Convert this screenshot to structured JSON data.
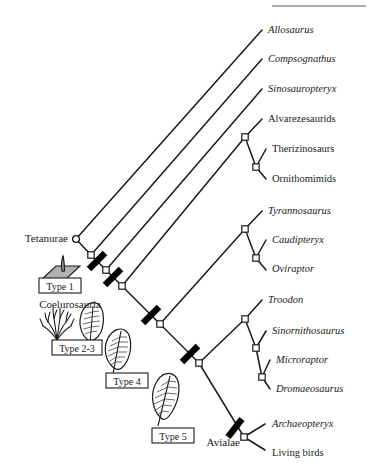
{
  "figure": {
    "top_rule": true,
    "colors": {
      "line": "#1a1a1a",
      "text": "#1a1a1a",
      "bar": "#000000",
      "patch_fill": "#b0b0b0",
      "background": "#ffffff"
    }
  },
  "tips": [
    {
      "id": "allosaurus",
      "label": "Allosaurus",
      "italic": true,
      "x": 268,
      "y": 33
    },
    {
      "id": "compsognathus",
      "label": "Compsognathus",
      "italic": true,
      "x": 268,
      "y": 62
    },
    {
      "id": "sinosauropteryx",
      "label": "Sinosauropteryx",
      "italic": true,
      "x": 268,
      "y": 92
    },
    {
      "id": "alvarezesaurids",
      "label": "Alvarezesaurids",
      "italic": false,
      "x": 268,
      "y": 122
    },
    {
      "id": "therizinosaurs",
      "label": "Therizinosaurs",
      "italic": false,
      "x": 272,
      "y": 152
    },
    {
      "id": "ornithomimids",
      "label": "Ornithomimids",
      "italic": false,
      "x": 272,
      "y": 182
    },
    {
      "id": "tyrannosaurus",
      "label": "Tyrannosaurus",
      "italic": true,
      "x": 268,
      "y": 214
    },
    {
      "id": "caudipteryx",
      "label": "Caudipteryx",
      "italic": true,
      "x": 272,
      "y": 243
    },
    {
      "id": "oviraptor",
      "label": "Oviraptor",
      "italic": true,
      "x": 272,
      "y": 272
    },
    {
      "id": "troodon",
      "label": "Troodon",
      "italic": true,
      "x": 268,
      "y": 303
    },
    {
      "id": "sinornithosaurus",
      "label": "Sinornithosaurus",
      "italic": true,
      "x": 272,
      "y": 334
    },
    {
      "id": "microraptor",
      "label": "Microraptor",
      "italic": true,
      "x": 276,
      "y": 363
    },
    {
      "id": "dromaeosaurus",
      "label": "Dromaeosaurus",
      "italic": true,
      "x": 276,
      "y": 392
    },
    {
      "id": "archaeopteryx",
      "label": "Archaeopteryx",
      "italic": true,
      "x": 272,
      "y": 427
    },
    {
      "id": "living_birds",
      "label": "Living birds",
      "italic": false,
      "x": 272,
      "y": 453
    }
  ],
  "clades": [
    {
      "id": "tetanurae",
      "label": "Tetanurae",
      "x": 68,
      "y": 242,
      "anchor": "end"
    },
    {
      "id": "coelurosauria",
      "label": "Coelurosauria",
      "x": 70,
      "y": 305,
      "anchor": "middle"
    },
    {
      "id": "avialae",
      "label": "Avialae",
      "x": 242,
      "y": 443,
      "anchor": "end"
    }
  ],
  "feather_types": [
    {
      "id": "type1",
      "label": "Type 1",
      "box_x": 39,
      "box_y": 278,
      "box_w": 42,
      "box_h": 14
    },
    {
      "id": "type2_3",
      "label": "Type 2-3",
      "box_x": 52,
      "box_y": 340,
      "box_w": 50,
      "box_h": 14
    },
    {
      "id": "type4",
      "label": "Type 4",
      "box_x": 106,
      "box_y": 373,
      "box_w": 42,
      "box_h": 14
    },
    {
      "id": "type5",
      "label": "Type 5",
      "box_x": 152,
      "box_y": 428,
      "box_w": 42,
      "box_h": 14
    }
  ],
  "icons": {
    "type1": "filament-on-skin-patch-icon",
    "type2_3": "branched-filament-tuft-icon",
    "type2_3b": "downy-feather-icon",
    "type4": "pennaceous-feather-icon",
    "type5": "asymmetric-flight-feather-icon",
    "node_open": "open-node-marker-icon",
    "bar": "character-state-bar-icon"
  },
  "nodes": [
    {
      "id": "n_tetanurae",
      "x": 76,
      "y": 239,
      "shape": "circle"
    },
    {
      "id": "n_coel",
      "x": 91,
      "y": 255,
      "shape": "square"
    },
    {
      "id": "n_b2",
      "x": 106,
      "y": 270,
      "shape": "square"
    },
    {
      "id": "n_b3",
      "x": 122,
      "y": 286,
      "shape": "square"
    },
    {
      "id": "n_b4",
      "x": 160,
      "y": 324,
      "shape": "square"
    },
    {
      "id": "n_b5",
      "x": 199,
      "y": 363,
      "shape": "square"
    },
    {
      "id": "n_b6",
      "x": 244,
      "y": 437,
      "shape": "square"
    },
    {
      "id": "n_mani1",
      "x": 245,
      "y": 137,
      "shape": "square"
    },
    {
      "id": "n_mani2",
      "x": 256,
      "y": 167,
      "shape": "square"
    },
    {
      "id": "n_ovi1",
      "x": 245,
      "y": 229,
      "shape": "square"
    },
    {
      "id": "n_ovi2",
      "x": 256,
      "y": 258,
      "shape": "square"
    },
    {
      "id": "n_dro1",
      "x": 245,
      "y": 319,
      "shape": "square"
    },
    {
      "id": "n_dro2",
      "x": 256,
      "y": 348,
      "shape": "square"
    },
    {
      "id": "n_dro3",
      "x": 262,
      "y": 377,
      "shape": "square"
    }
  ],
  "bars": [
    {
      "id": "bar_type1",
      "x": 97,
      "y": 261,
      "label_for": "Type 1"
    },
    {
      "id": "bar_type2_3",
      "x": 113,
      "y": 277,
      "label_for": "Type 2-3"
    },
    {
      "id": "bar_type4",
      "x": 151,
      "y": 315,
      "label_for": "Type 4"
    },
    {
      "id": "bar_type5",
      "x": 190,
      "y": 354,
      "label_for": "Type 5"
    },
    {
      "id": "bar_avialae",
      "x": 235,
      "y": 428,
      "label_for": "Avialae"
    }
  ]
}
